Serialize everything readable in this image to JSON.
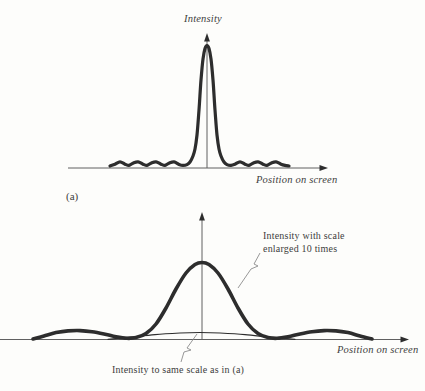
{
  "figure": {
    "background": "#fdfdfb",
    "curve_color": "#2d2d2d",
    "axis_color": "#606060",
    "leader_color": "#8c8c8c",
    "text_color": "#3d3d3d"
  },
  "panel_a": {
    "tag": "(a)",
    "y_axis_label": "Intensity",
    "x_axis_label": "Position on screen"
  },
  "panel_b": {
    "x_axis_label": "Position on screen",
    "annotation_enlarged_scale": "Intensity with scale\nenlarged 10 times",
    "annotation_same_scale": "Intensity to same scale as in (a)"
  },
  "chart_data": [
    {
      "panel": "a",
      "type": "line",
      "title": "Intensity vs position on screen — tall narrow central peak with small side ripples",
      "xlabel": "Position on screen",
      "ylabel": "Intensity",
      "axes_numeric": false,
      "axes_px": {
        "x": [
          68,
          168,
          328,
          168
        ],
        "y": [
          207,
          168,
          207,
          33
        ]
      },
      "series": [
        {
          "name": "intensity-pattern",
          "description": "sharp central maximum with weak secondary ripples on both sides",
          "stroke_width": 3.2,
          "points_px": [
            [
              110,
              166
            ],
            [
              115,
              164.2
            ],
            [
              120,
              161.8
            ],
            [
              125,
              164.2
            ],
            [
              129,
              165.4
            ],
            [
              133,
              163.2
            ],
            [
              138,
              161.8
            ],
            [
              143,
              164.2
            ],
            [
              147,
              165.4
            ],
            [
              151,
              163.2
            ],
            [
              156,
              161.8
            ],
            [
              161,
              164.2
            ],
            [
              165,
              165.4
            ],
            [
              169,
              163.2
            ],
            [
              174,
              161.8
            ],
            [
              179,
              164.4
            ],
            [
              183,
              165.4
            ],
            [
              187,
              164.6
            ],
            [
              190,
              162
            ],
            [
              193,
              156
            ],
            [
              195,
              149
            ],
            [
              197,
              135
            ],
            [
              199,
              110
            ],
            [
              201,
              80
            ],
            [
              203,
              59
            ],
            [
              205,
              48.5
            ],
            [
              207,
              45.5
            ],
            [
              209,
              48.5
            ],
            [
              211,
              59
            ],
            [
              213,
              80
            ],
            [
              215,
              110
            ],
            [
              217,
              135
            ],
            [
              219,
              149
            ],
            [
              221,
              156
            ],
            [
              224,
              162
            ],
            [
              227,
              164.6
            ],
            [
              231,
              165.4
            ],
            [
              235,
              164.2
            ],
            [
              240,
              161.8
            ],
            [
              245,
              164.2
            ],
            [
              249,
              165.4
            ],
            [
              253,
              163.2
            ],
            [
              258,
              161.8
            ],
            [
              263,
              164.2
            ],
            [
              267,
              165.4
            ],
            [
              271,
              163.2
            ],
            [
              276,
              161.8
            ],
            [
              281,
              164.2
            ],
            [
              285,
              165.4
            ],
            [
              289,
              166
            ]
          ]
        }
      ]
    },
    {
      "panel": "b",
      "type": "line",
      "title": "Same intensity pattern shown at two vertical scales",
      "xlabel": "Position on screen",
      "ylabel": "",
      "axes_numeric": false,
      "axes_px": {
        "x": [
          0,
          339.5,
          409,
          339.5
        ],
        "y": [
          202,
          339.5,
          202,
          212
        ]
      },
      "series": [
        {
          "name": "intensity-scale-enlarged-10-times",
          "description": "broad central maximum with low side lobes, vertical scale enlarged 10 times",
          "stroke_width": 3.6,
          "points_px": [
            [
              33,
              339
            ],
            [
              44,
              336
            ],
            [
              56,
              332.6
            ],
            [
              68,
              330.9
            ],
            [
              80,
              330.6
            ],
            [
              92,
              331.8
            ],
            [
              104,
              334
            ],
            [
              116,
              336.8
            ],
            [
              127,
              338.3
            ],
            [
              136,
              337.6
            ],
            [
              146,
              333.5
            ],
            [
              156,
              324
            ],
            [
              166,
              308
            ],
            [
              176,
              289
            ],
            [
              186,
              273
            ],
            [
              195,
              264.5
            ],
            [
              202,
              262.5
            ],
            [
              209,
              264.5
            ],
            [
              218,
              273
            ],
            [
              228,
              289
            ],
            [
              238,
              308
            ],
            [
              248,
              324
            ],
            [
              258,
              333.5
            ],
            [
              268,
              337.6
            ],
            [
              277,
              338.3
            ],
            [
              288,
              336.8
            ],
            [
              300,
              334
            ],
            [
              312,
              331.8
            ],
            [
              324,
              330.6
            ],
            [
              336,
              330.9
            ],
            [
              348,
              332.6
            ],
            [
              360,
              336
            ],
            [
              372,
              339
            ]
          ]
        },
        {
          "name": "intensity-same-scale-as-a",
          "description": "same curve drawn to the same scale as in (a): a very low shallow arc",
          "stroke_width": 1.2,
          "points_px": [
            [
              108,
              339.3
            ],
            [
              130,
              337.2
            ],
            [
              155,
              334.6
            ],
            [
              180,
              333
            ],
            [
              200,
              332.5
            ],
            [
              220,
              333
            ],
            [
              245,
              334.6
            ],
            [
              270,
              337.2
            ],
            [
              295,
              339.3
            ]
          ]
        }
      ],
      "leaders_px": [
        {
          "name": "leader-enlarged-scale",
          "points": [
            [
              260,
              253
            ],
            [
              254,
              264
            ],
            [
              258,
              266
            ],
            [
              251,
              269
            ],
            [
              238,
              288
            ]
          ]
        },
        {
          "name": "leader-same-scale",
          "points": [
            [
              197,
              334
            ],
            [
              187,
              348
            ],
            [
              191,
              350
            ],
            [
              184,
              352
            ],
            [
              181,
              362
            ]
          ]
        }
      ]
    }
  ]
}
